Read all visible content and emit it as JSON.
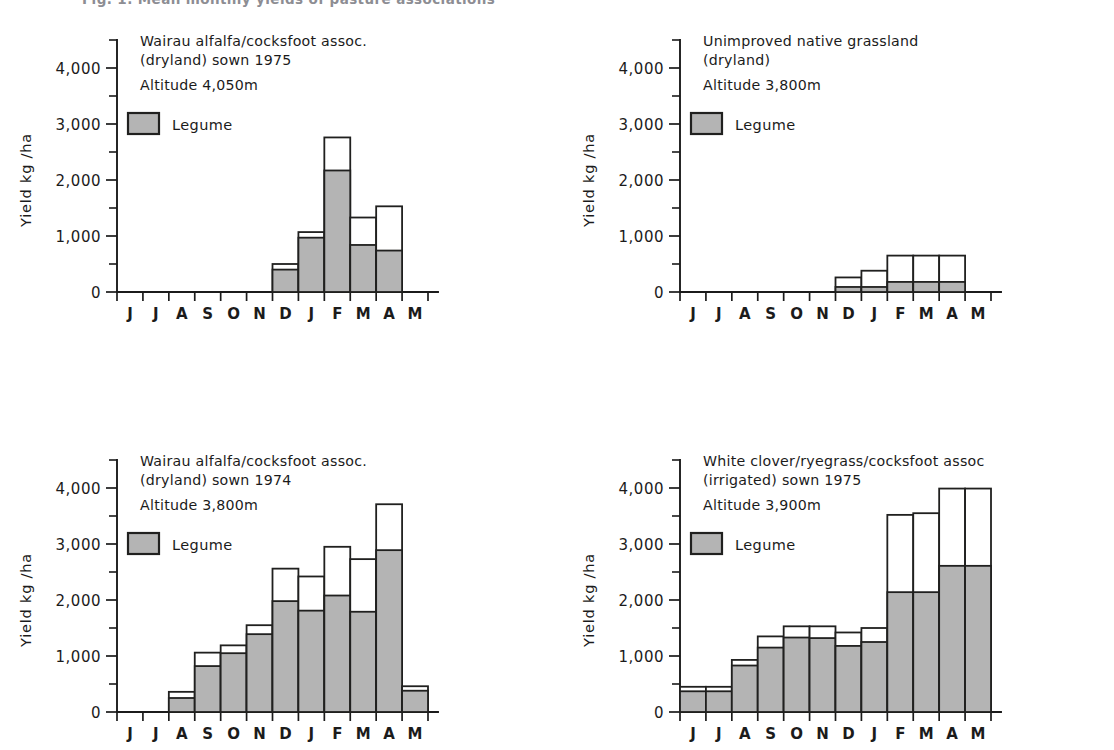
{
  "figure": {
    "caption_partial": "Fig. 1. Mean monthly yields of pasture associations",
    "legend_label": "Legume",
    "legume_fill_color": "#b4b4b4",
    "total_fill_color": "#ffffff",
    "outline_color": "#20201f",
    "axis_ylabel": "Yield kg /ha",
    "y_ticks": [
      "0",
      "1,000",
      "2,000",
      "3,000",
      "4,000"
    ],
    "x_ticks": [
      "J",
      "J",
      "A",
      "S",
      "O",
      "N",
      "D",
      "J",
      "F",
      "M",
      "A",
      "M"
    ]
  },
  "chart_data": [
    {
      "panel": "top-left",
      "type": "bar",
      "title": "Wairau alfalfa/cocksfoot assoc.",
      "subtitle": "(dryland) sown 1975",
      "altitude": "Altitude 4,050m",
      "legend": "Legume",
      "xlabel": "",
      "ylabel": "Yield kg /ha",
      "ylim": [
        0,
        4500
      ],
      "yticks": [
        0,
        1000,
        2000,
        3000,
        4000
      ],
      "minor_tick_step": 500,
      "grid": false,
      "categories": [
        "J",
        "J",
        "A",
        "S",
        "O",
        "N",
        "D",
        "J",
        "F",
        "M",
        "A",
        "M"
      ],
      "series": [
        {
          "name": "Total",
          "values": [
            0,
            0,
            0,
            0,
            0,
            0,
            500,
            1070,
            2760,
            1330,
            1530,
            0
          ]
        },
        {
          "name": "Legume",
          "values": [
            0,
            0,
            0,
            0,
            0,
            0,
            400,
            970,
            2170,
            840,
            740,
            0
          ]
        }
      ]
    },
    {
      "panel": "top-right",
      "type": "bar",
      "title": "Unimproved native grassland",
      "subtitle": "(dryland)",
      "altitude": "Altitude 3,800m",
      "legend": "Legume",
      "xlabel": "",
      "ylabel": "Yield kg /ha",
      "ylim": [
        0,
        4500
      ],
      "yticks": [
        0,
        1000,
        2000,
        3000,
        4000
      ],
      "minor_tick_step": 500,
      "grid": false,
      "categories": [
        "J",
        "J",
        "A",
        "S",
        "O",
        "N",
        "D",
        "J",
        "F",
        "M",
        "A",
        "M"
      ],
      "series": [
        {
          "name": "Total",
          "values": [
            0,
            0,
            0,
            0,
            0,
            0,
            260,
            380,
            650,
            650,
            650,
            0
          ]
        },
        {
          "name": "Legume",
          "values": [
            0,
            0,
            0,
            0,
            0,
            0,
            90,
            90,
            180,
            180,
            180,
            0
          ]
        }
      ]
    },
    {
      "panel": "bottom-left",
      "type": "bar",
      "title": "Wairau alfalfa/cocksfoot assoc.",
      "subtitle": "(dryland) sown 1974",
      "altitude": "Altitude 3,800m",
      "legend": "Legume",
      "xlabel": "",
      "ylabel": "Yield kg /ha",
      "ylim": [
        0,
        4500
      ],
      "yticks": [
        0,
        1000,
        2000,
        3000,
        4000
      ],
      "minor_tick_step": 500,
      "grid": false,
      "categories": [
        "J",
        "J",
        "A",
        "S",
        "O",
        "N",
        "D",
        "J",
        "F",
        "M",
        "A",
        "M"
      ],
      "series": [
        {
          "name": "Total",
          "values": [
            0,
            0,
            360,
            1060,
            1190,
            1550,
            2560,
            2420,
            2950,
            2730,
            3710,
            460
          ]
        },
        {
          "name": "Legume",
          "values": [
            0,
            0,
            250,
            820,
            1050,
            1390,
            1980,
            1810,
            2080,
            1790,
            2890,
            380
          ]
        }
      ]
    },
    {
      "panel": "bottom-right",
      "type": "bar",
      "title": "White clover/ryegrass/cocksfoot assoc",
      "subtitle": "(irrigated) sown 1975",
      "altitude": "Altitude 3,900m",
      "legend": "Legume",
      "xlabel": "",
      "ylabel": "Yield kg /ha",
      "ylim": [
        0,
        4500
      ],
      "yticks": [
        0,
        1000,
        2000,
        3000,
        4000
      ],
      "minor_tick_step": 500,
      "grid": false,
      "categories": [
        "J",
        "J",
        "A",
        "S",
        "O",
        "N",
        "D",
        "J",
        "F",
        "M",
        "A",
        "M"
      ],
      "series": [
        {
          "name": "Total",
          "values": [
            450,
            450,
            930,
            1350,
            1530,
            1530,
            1420,
            1500,
            3520,
            3550,
            3990,
            3990
          ]
        },
        {
          "name": "Legume",
          "values": [
            370,
            370,
            830,
            1150,
            1330,
            1320,
            1180,
            1250,
            2140,
            2140,
            2610,
            2610
          ]
        }
      ]
    }
  ]
}
